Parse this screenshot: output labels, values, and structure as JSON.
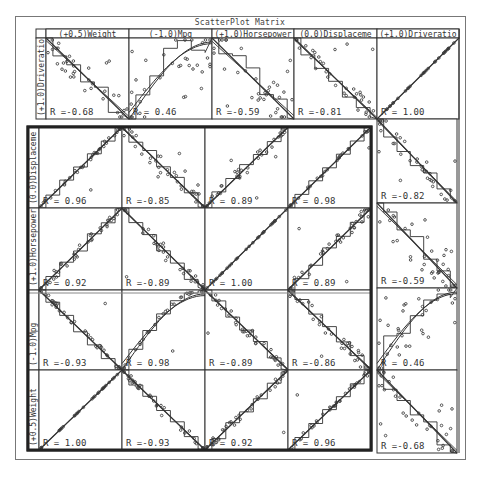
{
  "window": {
    "title": "ScatterPlot Matrix"
  },
  "colors": {
    "line": "#333333",
    "frame": "#777777",
    "point": "#444444",
    "background": "#ffffff"
  },
  "top_row": {
    "row_label": "(+1.0)Driveratio",
    "column_headers": [
      "(+0.5)Weight",
      "(-1.0)Mpg",
      "(+1.0)Horsepower",
      "(0.0)Displaceme",
      "(+1.0)Driveratio"
    ],
    "r_labels": [
      "R =-0.68",
      "R = 0.46",
      "R =-0.59",
      "R =-0.81",
      "R = 1.00"
    ]
  },
  "main_block": {
    "row_labels": [
      "(0.0)Displaceme",
      "(+1.0)Horsepower",
      "(-1.0)Mpg",
      "(+0.5)Weight"
    ],
    "r_labels": [
      [
        "R = 0.96",
        "R =-0.85",
        "R = 0.89",
        "R = 0.98"
      ],
      [
        "R = 0.92",
        "R =-0.89",
        "R = 1.00",
        "R = 0.89"
      ],
      [
        "R =-0.93",
        "R = 0.98",
        "R =-0.89",
        "R =-0.86"
      ],
      [
        "R = 1.00",
        "R =-0.93",
        "R = 0.92",
        "R = 0.96"
      ]
    ]
  },
  "right_column": {
    "r_labels": [
      "R =-0.82",
      "R =-0.59",
      "R = 0.46",
      "R =-0.68"
    ]
  },
  "chart_data": {
    "type": "scatter",
    "title": "ScatterPlot Matrix",
    "variables": [
      "Weight",
      "Mpg",
      "Horsepower",
      "Displacement",
      "Driveratio"
    ],
    "variable_weights": {
      "Weight": 0.5,
      "Mpg": -1.0,
      "Horsepower": 1.0,
      "Displacement": 0.0,
      "Driveratio": 1.0
    },
    "axis_labels": [
      "(+0.5)Weight",
      "(-1.0)Mpg",
      "(+1.0)Horsepower",
      "(0.0)Displaceme",
      "(+1.0)Driveratio"
    ],
    "correlations": {
      "Driveratio": {
        "Weight": -0.68,
        "Mpg": 0.46,
        "Horsepower": -0.59,
        "Displacement": -0.81,
        "Driveratio": 1.0
      },
      "Displacement": {
        "Weight": 0.96,
        "Mpg": -0.85,
        "Horsepower": 0.89,
        "Displacement": 0.98,
        "Driveratio": -0.82
      },
      "Horsepower": {
        "Weight": 0.92,
        "Mpg": -0.89,
        "Horsepower": 1.0,
        "Displacement": 0.89,
        "Driveratio": -0.59
      },
      "Mpg": {
        "Weight": -0.93,
        "Mpg": 0.98,
        "Horsepower": -0.89,
        "Displacement": -0.86,
        "Driveratio": 0.46
      },
      "Weight": {
        "Weight": 1.0,
        "Mpg": -0.93,
        "Horsepower": 0.92,
        "Displacement": 0.96,
        "Driveratio": -0.68
      }
    },
    "grid": true,
    "legend": "none",
    "overlays": [
      "linear fit",
      "smooth fit",
      "step fit"
    ]
  }
}
